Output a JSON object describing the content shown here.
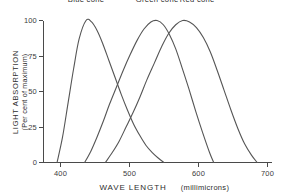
{
  "chart_data": {
    "type": "line",
    "title": "",
    "xlabel": "WAVE LENGTH",
    "xlabel_units": "(millimicrons)",
    "ylabel": "LIGHT ABSORPTION",
    "ylabel_sub": "(Per cent of maximum)",
    "xlim": [
      380,
      710
    ],
    "ylim": [
      0,
      100
    ],
    "xticks": [
      400,
      500,
      600,
      700
    ],
    "xtick_labels": [
      "400",
      "500",
      "600",
      "700"
    ],
    "yticks": [
      0,
      25,
      50,
      75,
      100
    ],
    "ytick_labels": [
      "0",
      "25",
      "50",
      "75",
      "100"
    ],
    "grid": false,
    "legend_position": "inline-above-peaks",
    "annotations": [
      {
        "text": "Blue cone",
        "x": 437,
        "y": 113
      },
      {
        "text": "Green cone",
        "x": 540,
        "y": 113
      },
      {
        "text": "Red cone",
        "x": 598,
        "y": 113
      }
    ],
    "series": [
      {
        "name": "Blue cone",
        "color": "#555555",
        "peak_x": 437,
        "peak_y": 100,
        "x": [
          395,
          403,
          411,
          419,
          427,
          437,
          445,
          453,
          461,
          470,
          479,
          488,
          497,
          506,
          515,
          524,
          533,
          542,
          550
        ],
        "values": [
          0,
          18,
          42,
          66,
          87,
          100,
          99,
          93,
          84,
          72,
          60,
          48,
          37,
          27,
          19,
          12,
          7,
          3,
          0
        ]
      },
      {
        "name": "Green cone",
        "color": "#555555",
        "peak_x": 540,
        "peak_y": 100,
        "x": [
          435,
          444,
          453,
          462,
          471,
          481,
          491,
          501,
          511,
          521,
          531,
          540,
          549,
          558,
          567,
          576,
          586,
          596,
          606,
          616,
          622
        ],
        "values": [
          0,
          8,
          18,
          29,
          41,
          53,
          65,
          76,
          86,
          94,
          99,
          100,
          97,
          90,
          80,
          67,
          52,
          36,
          21,
          7,
          0
        ]
      },
      {
        "name": "Red cone",
        "color": "#555555",
        "peak_x": 577,
        "peak_y": 100,
        "x": [
          465,
          475,
          485,
          495,
          505,
          515,
          525,
          536,
          547,
          557,
          567,
          577,
          587,
          597,
          607,
          617,
          627,
          637,
          647,
          657,
          667,
          677,
          685
        ],
        "values": [
          0,
          7,
          15,
          25,
          35,
          46,
          58,
          70,
          82,
          91,
          97,
          100,
          99,
          95,
          88,
          78,
          65,
          51,
          37,
          24,
          13,
          5,
          0
        ]
      }
    ]
  },
  "figure": {
    "axis_color": "#4a4a4a",
    "curve_color": "#555555",
    "background": "#ffffff"
  }
}
